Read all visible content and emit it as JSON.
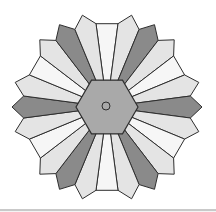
{
  "figure": {
    "title": ""
  },
  "geometry": {
    "center": [
      107,
      107
    ],
    "hexagon_radius": 31,
    "petal_count": 24,
    "petal_span_deg": 15,
    "shoulder_radius": 84,
    "tip_radius": 95,
    "white_shoulder_radius": 84,
    "start_angle_deg": 90,
    "center_circle": {
      "cx": 106,
      "cy": 106,
      "r": 4
    }
  },
  "pattern": [
    "white",
    "light",
    "dark",
    "light"
  ],
  "colors": {
    "white": "#f6f6f6",
    "light": "#e4e4e4",
    "dark": "#8a8a8a",
    "hexagon": "#a9a9a9",
    "stroke": "#2e2e2e",
    "background": "#ffffff",
    "bottom_rule": "#c9c9c9"
  }
}
